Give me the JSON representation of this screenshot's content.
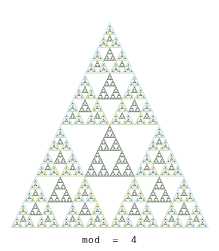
{
  "figure": {
    "title": "",
    "caption": "mod  =  4",
    "background": "#ffffff",
    "width": 219,
    "height": 251
  },
  "chart_data": {
    "type": "heatmap",
    "title": "",
    "subtitle": "",
    "xlabel": "",
    "ylabel": "",
    "annotations": [
      "mod  =  4"
    ],
    "modulus": 4,
    "rows": 128,
    "legend_position": "none",
    "grid": false,
    "residues": [
      0,
      1,
      2,
      3
    ],
    "residue_colors": {
      "0": "#ffffff",
      "1": "#b9dfea",
      "2": "#5d6e5c",
      "3": "#c9cd89"
    },
    "cell_labels": {
      "0": "zero (white, empty)",
      "1": "one (light blue)",
      "2": "two (dark slate green)",
      "3": "three (olive khaki)"
    },
    "apex": {
      "x": 109,
      "y": 22
    },
    "base_left": {
      "x": 10,
      "y": 228
    },
    "base_right": {
      "x": 208,
      "y": 228
    },
    "series": [
      {
        "name": "Pascal mod 4",
        "values": [
          [
            1
          ],
          [
            1,
            1
          ],
          [
            1,
            2,
            1
          ],
          [
            1,
            3,
            3,
            1
          ],
          [
            1,
            0,
            2,
            0,
            1
          ],
          [
            1,
            1,
            2,
            2,
            1,
            1
          ],
          [
            1,
            2,
            3,
            0,
            3,
            2,
            1
          ],
          [
            1,
            3,
            1,
            3,
            3,
            1,
            3,
            1
          ]
        ]
      }
    ],
    "xlim": [
      0,
      128
    ],
    "ylim": [
      0,
      128
    ]
  },
  "colors": {
    "background": "#ffffff",
    "caption_text": "#1a1a1a",
    "residue_1": "#b9dfea",
    "residue_2": "#5d6e5c",
    "residue_3": "#c9cd89",
    "residue_0": "#ffffff"
  }
}
